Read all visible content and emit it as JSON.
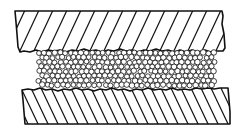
{
  "diagram": {
    "components": [
      {
        "id": "top-plate",
        "kind": "solid",
        "hatch": "diagonal-forward",
        "edge": "rough-bottom"
      },
      {
        "id": "granular-layer",
        "kind": "particles",
        "shape": "circle"
      },
      {
        "id": "bottom-plate",
        "kind": "solid",
        "hatch": "diagonal-backward",
        "edge": "rough-top"
      }
    ],
    "colors": {
      "stroke": "#111111",
      "background": "#ffffff",
      "particle_fill": "#ffffff"
    }
  }
}
